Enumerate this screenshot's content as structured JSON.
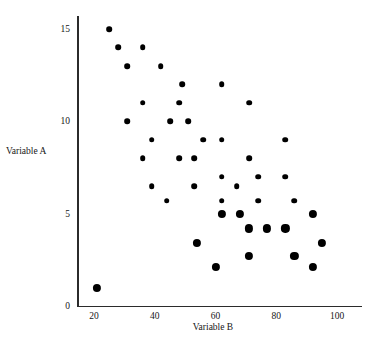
{
  "chart_data": {
    "type": "scatter",
    "title": "",
    "xlabel": "Variable B",
    "ylabel": "Variable A",
    "xlim": [
      13,
      107
    ],
    "ylim": [
      0,
      16.1
    ],
    "grid": false,
    "legend": null,
    "xticks": [
      20,
      40,
      60,
      80,
      100
    ],
    "yticks": [
      0,
      5,
      10,
      15
    ],
    "xtick_labels": [
      "20",
      "40",
      "60",
      "80",
      "100"
    ],
    "ytick_labels": [
      "0",
      "5",
      "10",
      "15"
    ],
    "marker_color": "#000000",
    "points": [
      {
        "x": 25,
        "y": 15,
        "size": "small"
      },
      {
        "x": 28,
        "y": 14,
        "size": "small"
      },
      {
        "x": 36,
        "y": 14,
        "size": "small"
      },
      {
        "x": 31,
        "y": 13,
        "size": "small"
      },
      {
        "x": 42,
        "y": 13,
        "size": "small"
      },
      {
        "x": 49,
        "y": 12,
        "size": "small"
      },
      {
        "x": 62,
        "y": 12,
        "size": "small"
      },
      {
        "x": 36,
        "y": 11,
        "size": "small"
      },
      {
        "x": 48,
        "y": 11,
        "size": "small"
      },
      {
        "x": 71,
        "y": 11,
        "size": "small"
      },
      {
        "x": 31,
        "y": 10,
        "size": "small"
      },
      {
        "x": 45,
        "y": 10,
        "size": "small"
      },
      {
        "x": 51,
        "y": 10,
        "size": "small"
      },
      {
        "x": 39,
        "y": 9,
        "size": "small"
      },
      {
        "x": 56,
        "y": 9,
        "size": "small"
      },
      {
        "x": 62,
        "y": 9,
        "size": "small"
      },
      {
        "x": 83,
        "y": 9,
        "size": "small"
      },
      {
        "x": 36,
        "y": 8,
        "size": "small"
      },
      {
        "x": 48,
        "y": 8,
        "size": "small"
      },
      {
        "x": 53,
        "y": 8,
        "size": "small"
      },
      {
        "x": 71,
        "y": 8,
        "size": "small"
      },
      {
        "x": 62,
        "y": 7,
        "size": "small"
      },
      {
        "x": 74,
        "y": 7,
        "size": "small"
      },
      {
        "x": 83,
        "y": 7,
        "size": "small"
      },
      {
        "x": 39,
        "y": 6.5,
        "size": "small"
      },
      {
        "x": 53,
        "y": 6.5,
        "size": "small"
      },
      {
        "x": 67,
        "y": 6.5,
        "size": "small"
      },
      {
        "x": 44,
        "y": 5.7,
        "size": "small"
      },
      {
        "x": 62,
        "y": 5.7,
        "size": "small"
      },
      {
        "x": 74,
        "y": 5.7,
        "size": "small"
      },
      {
        "x": 86,
        "y": 5.7,
        "size": "small"
      },
      {
        "x": 62,
        "y": 5,
        "size": "large"
      },
      {
        "x": 68,
        "y": 5,
        "size": "large"
      },
      {
        "x": 92,
        "y": 5,
        "size": "large"
      },
      {
        "x": 71,
        "y": 4.2,
        "size": "large"
      },
      {
        "x": 77,
        "y": 4.2,
        "size": "large"
      },
      {
        "x": 83,
        "y": 4.2,
        "size": "large"
      },
      {
        "x": 54,
        "y": 3.4,
        "size": "large"
      },
      {
        "x": 95,
        "y": 3.4,
        "size": "large"
      },
      {
        "x": 71,
        "y": 2.7,
        "size": "large"
      },
      {
        "x": 86,
        "y": 2.7,
        "size": "large"
      },
      {
        "x": 60,
        "y": 2.1,
        "size": "large"
      },
      {
        "x": 92,
        "y": 2.1,
        "size": "large"
      },
      {
        "x": 21,
        "y": 1,
        "size": "large"
      }
    ]
  }
}
